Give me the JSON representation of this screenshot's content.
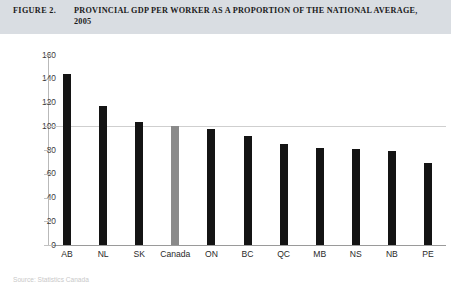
{
  "header": {
    "figure_label": "FIGURE 2.",
    "title": "PROVINCIAL GDP PER WORKER AS A PROPORTION OF THE NATIONAL AVERAGE, 2005",
    "background_color": "#d9dde2"
  },
  "footer": {
    "source": "Source: Statistics Canada"
  },
  "colors": {
    "bar_default": "#141414",
    "bar_highlight": "#8a8a8a",
    "axis": "#9a9a9a",
    "gridline": "#cfcfcf"
  },
  "chart_data": {
    "type": "bar",
    "title": "PROVINCIAL GDP PER WORKER AS A PROPORTION OF THE NATIONAL AVERAGE, 2005",
    "xlabel": "",
    "ylabel": "Percent",
    "ylim": [
      0,
      160
    ],
    "ytick_step": 20,
    "yticks": [
      160,
      140,
      120,
      100,
      80,
      60,
      40,
      20,
      0
    ],
    "grid": false,
    "reference_line": 100,
    "legend": null,
    "categories": [
      "AB",
      "NL",
      "SK",
      "Canada",
      "ON",
      "BC",
      "QC",
      "MB",
      "NS",
      "NB",
      "PE"
    ],
    "values": [
      144,
      117,
      104,
      100,
      98,
      92,
      85,
      82,
      81,
      79,
      69
    ],
    "highlight_category": "Canada"
  }
}
